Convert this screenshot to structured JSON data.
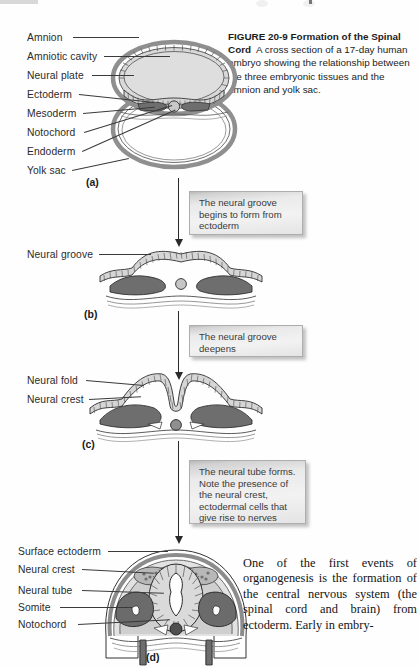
{
  "figure": {
    "number": "FIGURE 20-9",
    "title": "Formation of the Spinal Cord",
    "caption_body": "A cross section of a 17-day human embryo showing the relationship between the three embryonic tissues and the amnion and yolk sac."
  },
  "panels": [
    {
      "letter": "(a)",
      "labels": [
        "Amnion",
        "Amniotic cavity",
        "Neural plate",
        "Ectoderm",
        "Mesoderm",
        "Notochord",
        "Endoderm",
        "Yolk sac"
      ]
    },
    {
      "letter": "(b)",
      "labels": [
        "Neural groove"
      ]
    },
    {
      "letter": "(c)",
      "labels": [
        "Neural fold",
        "Neural crest"
      ]
    },
    {
      "letter": "(d)",
      "labels": [
        "Surface ectoderm",
        "Neural crest",
        "Neural tube",
        "Somite",
        "Notochord"
      ]
    }
  ],
  "callouts": [
    "The neural groove begins to form from ectoderm",
    "The neural groove deepens",
    "The neural tube forms. Note the presence of the neural crest, ectodermal cells that give rise to nerves"
  ],
  "body_text": {
    "paragraph": "One of the first events of organogenesis is the formation of the central nervous system (the spinal cord and brain) from ectoderm. Early in embry-"
  },
  "colors": {
    "ink": "#1a1a1a",
    "mesoderm_dark": "#6e6e6e",
    "tissue_mid": "#a8a8a8",
    "cavity_fill": "#dcdcdc",
    "ectoderm_hatch": "#555555",
    "callout_face": "#eeeeee",
    "callout_border": "#aeaeae"
  }
}
